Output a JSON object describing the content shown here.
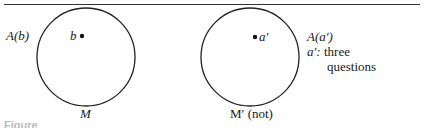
{
  "figure": {
    "left_diagram": {
      "set_label": "A(b)",
      "point_label": "b",
      "circle_label": "M"
    },
    "right_diagram": {
      "point_label": "a′",
      "set_label": "A(a′)",
      "annotation_prefix": "a′:",
      "annotation_line1": "three",
      "annotation_line2": "questions",
      "circle_label": "M′ (not)"
    },
    "caption": "Figure"
  }
}
